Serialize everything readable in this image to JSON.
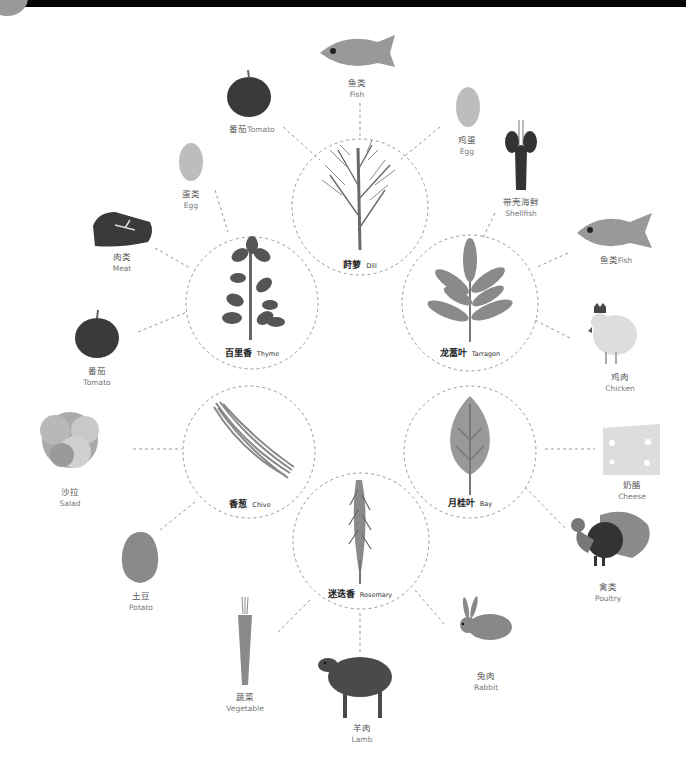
{
  "colors": {
    "background": "#ffffff",
    "top_bar": "#050505",
    "dark_gray": "#3f3f3f",
    "mid_gray": "#8a8a8a",
    "light_gray": "#c4c4c4",
    "dashed_line": "#999999"
  },
  "herbs": [
    {
      "id": "dill",
      "cn": "莳萝",
      "en": "Dill"
    },
    {
      "id": "thyme",
      "cn": "百里香",
      "en": "Thyme"
    },
    {
      "id": "tarragon",
      "cn": "龙蒿叶",
      "en": "Tarragon"
    },
    {
      "id": "chive",
      "cn": "香葱",
      "en": "Chive"
    },
    {
      "id": "bay",
      "cn": "月桂叶",
      "en": "Bay"
    },
    {
      "id": "rosemary",
      "cn": "迷迭香",
      "en": "Rosemary"
    }
  ],
  "foods": {
    "dill_fish": {
      "cn": "鱼类",
      "en": "Fish"
    },
    "dill_tomato": {
      "cn": "番茄",
      "en": "Tomato"
    },
    "dill_egg": {
      "cn": "鸡蛋",
      "en": "Egg"
    },
    "tarragon_shellfish": {
      "cn": "带壳海鲜",
      "en": "Shellfish"
    },
    "tarragon_fish": {
      "cn": "鱼类",
      "en": "Fish"
    },
    "tarragon_chicken": {
      "cn": "鸡肉",
      "en": "Chicken"
    },
    "thyme_egg": {
      "cn": "蛋类",
      "en": "Egg"
    },
    "thyme_meat": {
      "cn": "肉类",
      "en": "Meat"
    },
    "thyme_tomato": {
      "cn": "番茄",
      "en": "Tomato"
    },
    "chive_salad": {
      "cn": "沙拉",
      "en": "Salad"
    },
    "chive_potato": {
      "cn": "土豆",
      "en": "Potato"
    },
    "bay_cheese": {
      "cn": "奶酪",
      "en": "Cheese"
    },
    "bay_poultry": {
      "cn": "禽类",
      "en": "Poultry"
    },
    "rosemary_vegetable": {
      "cn": "蔬菜",
      "en": "Vegetable"
    },
    "rosemary_lamb": {
      "cn": "羊肉",
      "en": "Lamb"
    },
    "rosemary_rabbit": {
      "cn": "兔肉",
      "en": "Rabbit"
    }
  }
}
